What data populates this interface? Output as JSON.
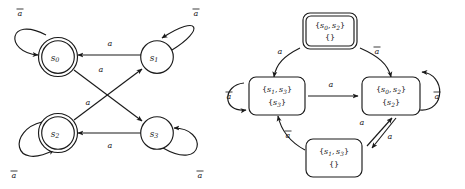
{
  "figure": {
    "background_color": "#ffffff",
    "ink_color": "#1a1a1a",
    "alphabet": [
      "a",
      "a-bar"
    ],
    "symbols": {
      "a": "a",
      "a_bar": "a",
      "a_bar_note": "a with overbar"
    }
  },
  "left_automaton": {
    "name": "nfa",
    "type": "nondeterministic-finite-automaton",
    "node_shape": "circle",
    "states": [
      {
        "id": "s0",
        "base": "s",
        "sub": "0",
        "accepting": true,
        "cx": 58,
        "cy": 57
      },
      {
        "id": "s1",
        "base": "s",
        "sub": "1",
        "accepting": false,
        "cx": 157,
        "cy": 57
      },
      {
        "id": "s2",
        "base": "s",
        "sub": "2",
        "accepting": true,
        "cx": 58,
        "cy": 133
      },
      {
        "id": "s3",
        "base": "s",
        "sub": "3",
        "accepting": false,
        "cx": 157,
        "cy": 133
      }
    ],
    "transitions": [
      {
        "from": "s1",
        "to": "s0",
        "label": "a",
        "kind": "straight"
      },
      {
        "from": "s3",
        "to": "s2",
        "label": "a",
        "kind": "straight"
      },
      {
        "from": "s0",
        "to": "s3",
        "label": "a",
        "kind": "diagonal"
      },
      {
        "from": "s2",
        "to": "s1",
        "label": "a",
        "kind": "diagonal"
      },
      {
        "from": "s0",
        "to": "s0",
        "label": "a-bar",
        "kind": "self-loop"
      },
      {
        "from": "s1",
        "to": "s1",
        "label": "a-bar",
        "kind": "self-loop"
      },
      {
        "from": "s2",
        "to": "s2",
        "label": "a-bar",
        "kind": "self-loop"
      },
      {
        "from": "s3",
        "to": "s3",
        "label": "a-bar",
        "kind": "self-loop"
      }
    ],
    "edge_labels": {
      "s1_s0": "a",
      "s3_s2": "a",
      "s0_s3": "a",
      "s2_s1": "a",
      "loop_s0": "a-bar",
      "loop_s1": "a-bar",
      "loop_s2": "a-bar",
      "loop_s3": "a-bar"
    }
  },
  "right_automaton": {
    "name": "dfa",
    "type": "deterministic-finite-automaton",
    "node_shape": "rounded-rectangle",
    "states": [
      {
        "id": "top",
        "line1_set": [
          "s0",
          "s2"
        ],
        "line2_set": [],
        "double_border": true,
        "cx": 330,
        "cy": 34
      },
      {
        "id": "left",
        "line1_set": [
          "s1",
          "s3"
        ],
        "line2_set": [
          "s3"
        ],
        "double_border": false,
        "cx": 276,
        "cy": 96
      },
      {
        "id": "right",
        "line1_set": [
          "s0",
          "s2"
        ],
        "line2_set": [
          "s2"
        ],
        "double_border": false,
        "cx": 392,
        "cy": 96
      },
      {
        "id": "bottom",
        "line1_set": [
          "s1",
          "s3"
        ],
        "line2_set": [],
        "double_border": false,
        "cx": 334,
        "cy": 158
      }
    ],
    "transitions": [
      {
        "from": "top",
        "to": "left",
        "label": "a",
        "kind": "curve"
      },
      {
        "from": "top",
        "to": "right",
        "label": "a-bar",
        "kind": "curve"
      },
      {
        "from": "left",
        "to": "right",
        "label": "a",
        "kind": "straight"
      },
      {
        "from": "bottom",
        "to": "left",
        "label": "a-bar",
        "kind": "curve"
      },
      {
        "from": "bottom",
        "to": "right",
        "label": "a",
        "kind": "parallel-up"
      },
      {
        "from": "right",
        "to": "bottom",
        "label": "a",
        "kind": "parallel-down"
      },
      {
        "from": "left",
        "to": "left",
        "label": "a-bar",
        "kind": "self-loop"
      },
      {
        "from": "right",
        "to": "right",
        "label": "a-bar",
        "kind": "self-loop"
      }
    ],
    "edge_labels": {
      "top_left": "a",
      "top_right": "a-bar",
      "left_right": "a",
      "bottom_left": "a-bar",
      "bottom_right": "a",
      "right_bottom": "a",
      "loop_left": "a-bar",
      "loop_right": "a-bar"
    }
  }
}
